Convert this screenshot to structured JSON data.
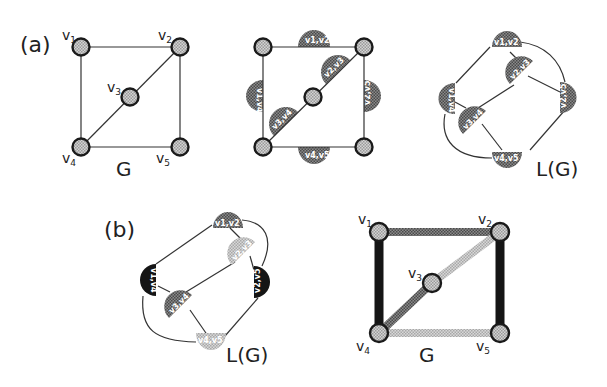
{
  "figure": {
    "panel_a": {
      "label": "(a)",
      "graph_G": {
        "label": "G",
        "vertices": [
          {
            "id": "v1",
            "base": "v",
            "sub": "1"
          },
          {
            "id": "v2",
            "base": "v",
            "sub": "2"
          },
          {
            "id": "v3",
            "base": "v",
            "sub": "3"
          },
          {
            "id": "v4",
            "base": "v",
            "sub": "4"
          },
          {
            "id": "v5",
            "base": "v",
            "sub": "5"
          }
        ],
        "edges": [
          [
            "v1",
            "v2"
          ],
          [
            "v1",
            "v4"
          ],
          [
            "v2",
            "v3"
          ],
          [
            "v3",
            "v4"
          ],
          [
            "v2",
            "v5"
          ],
          [
            "v4",
            "v5"
          ]
        ]
      },
      "graph_edge_nodes": {
        "edge_labels": [
          "v1,v2",
          "v2,v3",
          "v1,v4",
          "v3,v4",
          "v2,v5",
          "v4,v5"
        ]
      },
      "line_graph": {
        "label": "L(G)",
        "nodes": [
          "v1,v2",
          "v2,v3",
          "v1,v4",
          "v3,v4",
          "v2,v5",
          "v4,v5"
        ]
      }
    },
    "panel_b": {
      "label": "(b)",
      "line_graph": {
        "label": "L(G)",
        "nodes": [
          {
            "text": "v1,v2",
            "shade": "medium"
          },
          {
            "text": "v2,v3",
            "shade": "light"
          },
          {
            "text": "v1,v4",
            "shade": "black"
          },
          {
            "text": "v3,v4",
            "shade": "medium"
          },
          {
            "text": "v2,v5",
            "shade": "black"
          },
          {
            "text": "v4,v5",
            "shade": "light"
          }
        ]
      },
      "graph_G": {
        "label": "G",
        "vertices": [
          {
            "id": "v1",
            "base": "v",
            "sub": "1"
          },
          {
            "id": "v2",
            "base": "v",
            "sub": "2"
          },
          {
            "id": "v3",
            "base": "v",
            "sub": "3"
          },
          {
            "id": "v4",
            "base": "v",
            "sub": "4"
          },
          {
            "id": "v5",
            "base": "v",
            "sub": "5"
          }
        ],
        "edge_colors": {
          "v1-v2": "medium",
          "v2-v3": "light",
          "v3-v4": "medium",
          "v1-v4": "black",
          "v2-v5": "black",
          "v4-v5": "light"
        }
      }
    },
    "colors": {
      "black": "#151515",
      "medium": "#6e6e6e",
      "light": "#b8b8b8",
      "node_fill": "#c4c4c4",
      "stroke": "#1a1a1a"
    }
  }
}
